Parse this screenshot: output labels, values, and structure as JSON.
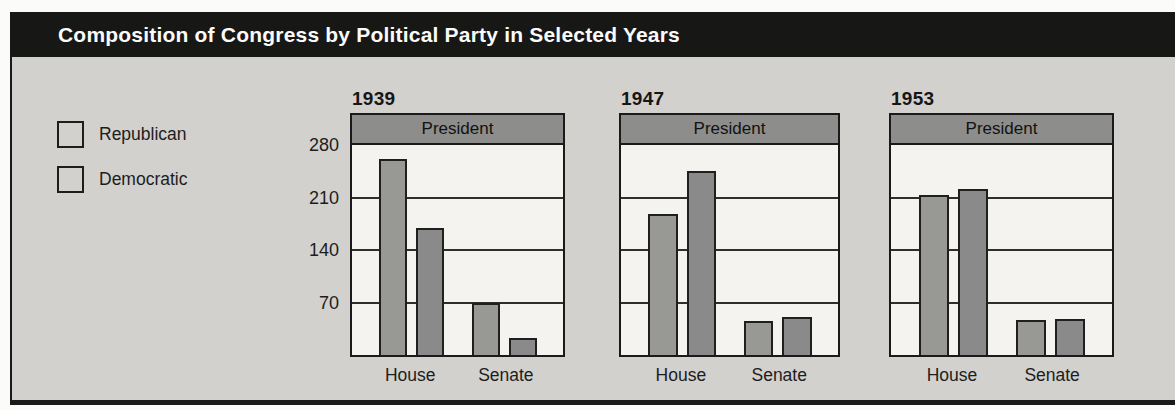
{
  "title": "Composition of Congress by Political Party in Selected Years",
  "colors": {
    "title_bar_bg": "#171716",
    "title_text": "#fbfbfb",
    "panel_bg": "#d2d1ce",
    "plot_bg": "#f4f3ef",
    "banner_fill": "#8d8d8b",
    "republican": "#8a8a8a",
    "democratic": "#989895",
    "border": "#1a1a1a"
  },
  "legend": {
    "items": [
      {
        "label": "Republican",
        "color": "#8a8a8a"
      },
      {
        "label": "Democratic",
        "color": "#989895"
      }
    ]
  },
  "chart_data": {
    "type": "bar",
    "title": "Composition of Congress by Political Party in Selected Years",
    "categories": [
      "House",
      "Senate"
    ],
    "banner_label": "President",
    "ylim": [
      0,
      280
    ],
    "y_ticks": [
      280,
      210,
      140,
      70
    ],
    "gridlines": true,
    "legend_position": "left",
    "bar_order_note": "within each category group the left bar is Democratic, the right bar is Republican",
    "charts": [
      {
        "year": "1939",
        "series": [
          {
            "name": "Democratic",
            "values": [
              262,
              69
            ]
          },
          {
            "name": "Republican",
            "values": [
              169,
              23
            ]
          }
        ]
      },
      {
        "year": "1947",
        "series": [
          {
            "name": "Democratic",
            "values": [
              188,
              45
            ]
          },
          {
            "name": "Republican",
            "values": [
              246,
              51
            ]
          }
        ]
      },
      {
        "year": "1953",
        "series": [
          {
            "name": "Democratic",
            "values": [
              213,
              47
            ]
          },
          {
            "name": "Republican",
            "values": [
              221,
              48
            ]
          }
        ]
      }
    ]
  }
}
